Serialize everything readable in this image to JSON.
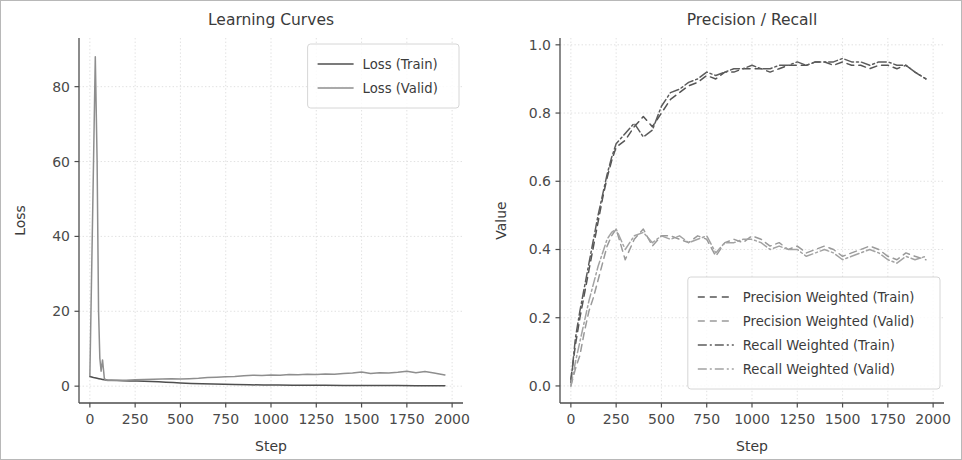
{
  "figure": {
    "background": "#ffffff",
    "frame_color": "#b8b8b8",
    "width": 962,
    "height": 460
  },
  "chart_data": [
    {
      "id": "learning-curves",
      "type": "line",
      "title": "Learning Curves",
      "xlabel": "Step",
      "ylabel": "Loss",
      "xlim": [
        -60,
        2060
      ],
      "ylim": [
        -4.5,
        93
      ],
      "xticks": [
        0,
        250,
        500,
        750,
        1000,
        1250,
        1500,
        1750,
        2000
      ],
      "xticklabels": [
        "0",
        "250",
        "500",
        "750",
        "1000",
        "1250",
        "1500",
        "1750",
        "2000"
      ],
      "yticks": [
        0,
        20,
        40,
        60,
        80
      ],
      "yticklabels": [
        "0",
        "20",
        "40",
        "60",
        "80"
      ],
      "grid": true,
      "legend_position": "upper right",
      "series": [
        {
          "name": "Loss (Train)",
          "color": "#4f4f4f",
          "dash": "none",
          "width": 1.5,
          "x": [
            0,
            20,
            40,
            50,
            60,
            70,
            80,
            100,
            120,
            150,
            180,
            220,
            260,
            300,
            340,
            380,
            420,
            460,
            500,
            560,
            620,
            680,
            740,
            800,
            880,
            960,
            1040,
            1120,
            1200,
            1300,
            1400,
            1500,
            1600,
            1700,
            1800,
            1900,
            1960
          ],
          "y": [
            2.6,
            2.3,
            2.1,
            2.0,
            1.9,
            1.8,
            1.7,
            1.6,
            1.55,
            1.5,
            1.45,
            1.4,
            1.35,
            1.3,
            1.25,
            1.15,
            1.05,
            0.95,
            0.85,
            0.72,
            0.62,
            0.55,
            0.48,
            0.42,
            0.36,
            0.32,
            0.28,
            0.26,
            0.24,
            0.21,
            0.19,
            0.17,
            0.16,
            0.15,
            0.14,
            0.13,
            0.12
          ]
        },
        {
          "name": "Loss (Valid)",
          "color": "#8e8e8e",
          "dash": "none",
          "width": 1.5,
          "x": [
            0,
            15,
            30,
            40,
            48,
            55,
            62,
            70,
            80,
            90,
            100,
            120,
            150,
            200,
            250,
            300,
            350,
            400,
            450,
            500,
            550,
            600,
            650,
            700,
            750,
            800,
            850,
            900,
            950,
            1000,
            1050,
            1100,
            1150,
            1200,
            1250,
            1300,
            1350,
            1400,
            1450,
            1500,
            1550,
            1600,
            1650,
            1700,
            1750,
            1800,
            1850,
            1900,
            1960
          ],
          "y": [
            2.8,
            45.0,
            88.0,
            60.0,
            20.0,
            7.5,
            4.0,
            7.0,
            2.0,
            1.6,
            1.5,
            1.5,
            1.55,
            1.6,
            1.7,
            1.8,
            1.85,
            1.9,
            1.95,
            1.9,
            2.0,
            2.1,
            2.3,
            2.4,
            2.5,
            2.6,
            2.8,
            2.9,
            2.85,
            3.0,
            2.9,
            3.1,
            3.05,
            3.2,
            3.1,
            3.25,
            3.15,
            3.4,
            3.5,
            3.8,
            3.4,
            3.6,
            3.5,
            3.7,
            4.0,
            3.6,
            3.9,
            3.5,
            3.0
          ]
        }
      ]
    },
    {
      "id": "precision-recall",
      "type": "line",
      "title": "Precision / Recall",
      "xlabel": "Step",
      "ylabel": "Value",
      "xlim": [
        -60,
        2060
      ],
      "ylim": [
        -0.05,
        1.02
      ],
      "xticks": [
        0,
        250,
        500,
        750,
        1000,
        1250,
        1500,
        1750,
        2000
      ],
      "xticklabels": [
        "0",
        "250",
        "500",
        "750",
        "1000",
        "1250",
        "1500",
        "1750",
        "2000"
      ],
      "yticks": [
        0.0,
        0.2,
        0.4,
        0.6,
        0.8,
        1.0
      ],
      "yticklabels": [
        "0.0",
        "0.2",
        "0.4",
        "0.6",
        "0.8",
        "1.0"
      ],
      "grid": true,
      "legend_position": "lower right",
      "series": [
        {
          "name": "Precision Weighted (Train)",
          "color": "#555555",
          "dash": "7 5",
          "width": 1.5,
          "x": [
            0,
            25,
            50,
            75,
            100,
            125,
            150,
            175,
            200,
            225,
            250,
            300,
            350,
            400,
            450,
            500,
            550,
            600,
            650,
            700,
            750,
            800,
            850,
            900,
            950,
            1000,
            1050,
            1100,
            1150,
            1200,
            1250,
            1300,
            1350,
            1400,
            1450,
            1500,
            1550,
            1600,
            1650,
            1700,
            1750,
            1800,
            1850,
            1900,
            1960
          ],
          "y": [
            0.02,
            0.12,
            0.2,
            0.27,
            0.34,
            0.41,
            0.48,
            0.55,
            0.61,
            0.66,
            0.7,
            0.72,
            0.76,
            0.79,
            0.76,
            0.8,
            0.84,
            0.86,
            0.88,
            0.89,
            0.91,
            0.9,
            0.92,
            0.92,
            0.93,
            0.93,
            0.93,
            0.92,
            0.93,
            0.94,
            0.94,
            0.94,
            0.95,
            0.95,
            0.94,
            0.95,
            0.94,
            0.94,
            0.93,
            0.94,
            0.94,
            0.93,
            0.94,
            0.92,
            0.9
          ]
        },
        {
          "name": "Precision Weighted (Valid)",
          "color": "#9a9a9a",
          "dash": "7 5",
          "width": 1.5,
          "x": [
            0,
            25,
            50,
            75,
            100,
            125,
            150,
            175,
            200,
            225,
            250,
            300,
            350,
            400,
            450,
            500,
            550,
            600,
            650,
            700,
            750,
            800,
            850,
            900,
            950,
            1000,
            1050,
            1100,
            1150,
            1200,
            1250,
            1300,
            1350,
            1400,
            1450,
            1500,
            1550,
            1600,
            1650,
            1700,
            1750,
            1800,
            1850,
            1900,
            1960
          ],
          "y": [
            0.0,
            0.05,
            0.09,
            0.16,
            0.22,
            0.26,
            0.31,
            0.36,
            0.41,
            0.44,
            0.46,
            0.37,
            0.43,
            0.46,
            0.41,
            0.44,
            0.44,
            0.43,
            0.42,
            0.44,
            0.43,
            0.38,
            0.42,
            0.43,
            0.42,
            0.44,
            0.43,
            0.41,
            0.42,
            0.4,
            0.41,
            0.39,
            0.4,
            0.41,
            0.4,
            0.38,
            0.39,
            0.4,
            0.41,
            0.4,
            0.38,
            0.37,
            0.39,
            0.38,
            0.37
          ]
        },
        {
          "name": "Recall Weighted (Train)",
          "color": "#5c5c5c",
          "dash": "9 3 2 3",
          "width": 1.5,
          "x": [
            0,
            25,
            50,
            75,
            100,
            125,
            150,
            175,
            200,
            225,
            250,
            300,
            350,
            400,
            450,
            500,
            550,
            600,
            650,
            700,
            750,
            800,
            850,
            900,
            950,
            1000,
            1050,
            1100,
            1150,
            1200,
            1250,
            1300,
            1350,
            1400,
            1450,
            1500,
            1550,
            1600,
            1650,
            1700,
            1750,
            1800,
            1850,
            1900,
            1960
          ],
          "y": [
            0.01,
            0.14,
            0.22,
            0.29,
            0.36,
            0.43,
            0.5,
            0.56,
            0.62,
            0.67,
            0.71,
            0.74,
            0.77,
            0.73,
            0.75,
            0.82,
            0.86,
            0.87,
            0.89,
            0.9,
            0.92,
            0.91,
            0.92,
            0.93,
            0.93,
            0.94,
            0.93,
            0.93,
            0.94,
            0.94,
            0.95,
            0.94,
            0.95,
            0.95,
            0.95,
            0.96,
            0.95,
            0.95,
            0.94,
            0.95,
            0.95,
            0.94,
            0.94,
            0.92,
            0.9
          ]
        },
        {
          "name": "Recall Weighted (Valid)",
          "color": "#a3a3a3",
          "dash": "9 3 2 3",
          "width": 1.5,
          "x": [
            0,
            25,
            50,
            75,
            100,
            125,
            150,
            175,
            200,
            225,
            250,
            300,
            350,
            400,
            450,
            500,
            550,
            600,
            650,
            700,
            750,
            800,
            850,
            900,
            950,
            1000,
            1050,
            1100,
            1150,
            1200,
            1250,
            1300,
            1350,
            1400,
            1450,
            1500,
            1550,
            1600,
            1650,
            1700,
            1750,
            1800,
            1850,
            1900,
            1960
          ],
          "y": [
            0.0,
            0.07,
            0.13,
            0.19,
            0.25,
            0.3,
            0.35,
            0.39,
            0.43,
            0.45,
            0.46,
            0.4,
            0.44,
            0.45,
            0.42,
            0.44,
            0.43,
            0.44,
            0.42,
            0.43,
            0.44,
            0.39,
            0.42,
            0.42,
            0.43,
            0.43,
            0.42,
            0.4,
            0.41,
            0.4,
            0.4,
            0.38,
            0.39,
            0.4,
            0.39,
            0.37,
            0.38,
            0.39,
            0.4,
            0.39,
            0.37,
            0.36,
            0.38,
            0.37,
            0.38
          ]
        }
      ]
    }
  ]
}
